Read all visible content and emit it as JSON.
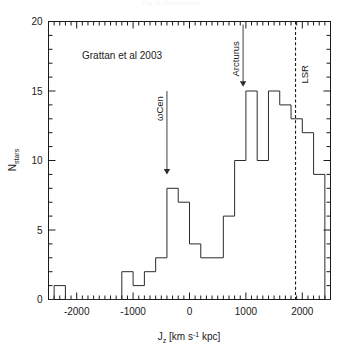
{
  "figure": {
    "top_caption": "Fig. 6. Distribution",
    "credit_text": "Grattan et al 2003"
  },
  "annotations": {
    "omega_cen": {
      "label": "ωCen",
      "x_value": -400
    },
    "arcturus": {
      "label": "Arcturus",
      "x_value": 950
    },
    "lsr": {
      "label": "LSR",
      "x_value": 1880
    }
  },
  "axes": {
    "x_label_main": "J",
    "x_label_sub": "z",
    "x_label_rest": " [km s",
    "x_label_sup": "-1",
    "x_label_tail": " kpc]",
    "y_label_main": "N",
    "y_label_sub": "stars",
    "x_tick_labels": [
      "-2000",
      "-1000",
      "0",
      "1000",
      "2000"
    ],
    "x_tick_values": [
      -2000,
      -1000,
      0,
      1000,
      2000
    ],
    "y_tick_labels": [
      "0",
      "5",
      "10",
      "15",
      "20"
    ],
    "y_tick_values": [
      0,
      5,
      10,
      15,
      20
    ]
  },
  "chart_data": {
    "type": "bar",
    "title": "",
    "subtitle": "",
    "xlabel": "J_z [km s^-1 kpc]",
    "ylabel": "N_stars",
    "xlim": [
      -2500,
      2500
    ],
    "ylim": [
      0,
      20
    ],
    "grid": false,
    "legend_position": "none",
    "bin_width": 200,
    "histogram_style": "step",
    "bin_left_edges": [
      -2400,
      -2200,
      -2000,
      -1800,
      -1600,
      -1400,
      -1200,
      -1000,
      -800,
      -600,
      -400,
      -200,
      0,
      200,
      400,
      600,
      800,
      1000,
      1200,
      1400,
      1600,
      1800,
      2000,
      2200
    ],
    "bin_centers": [
      -2300,
      -2100,
      -1900,
      -1700,
      -1500,
      -1300,
      -1100,
      -900,
      -700,
      -500,
      -300,
      -100,
      100,
      300,
      500,
      700,
      900,
      1100,
      1300,
      1500,
      1700,
      1900,
      2100,
      2300
    ],
    "categories": [
      "-2300",
      "-2100",
      "-1900",
      "-1700",
      "-1500",
      "-1300",
      "-1100",
      "-900",
      "-700",
      "-500",
      "-300",
      "-100",
      "100",
      "300",
      "500",
      "700",
      "900",
      "1100",
      "1300",
      "1500",
      "1700",
      "1900",
      "2100",
      "2300"
    ],
    "values": [
      1,
      0,
      0,
      0,
      0,
      0,
      2,
      1,
      2,
      3,
      8,
      7,
      4,
      3,
      3,
      6,
      10,
      15,
      10,
      15,
      14,
      13,
      12,
      9
    ],
    "annotations": [
      {
        "text": "ωCen",
        "x": -400,
        "y": 9,
        "type": "arrow-down"
      },
      {
        "text": "Arcturus",
        "x": 950,
        "y": 15.3,
        "type": "arrow-down"
      },
      {
        "text": "LSR",
        "x": 1880,
        "type": "vline-dashed"
      },
      {
        "text": "Grattan et al 2003",
        "x": -1500,
        "y": 18.3,
        "type": "text"
      }
    ]
  }
}
